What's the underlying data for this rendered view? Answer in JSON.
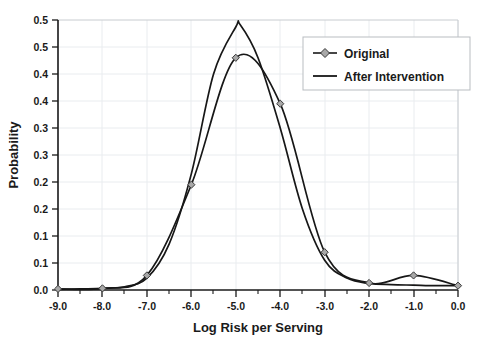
{
  "chart_data": {
    "type": "line",
    "title": "",
    "xlabel": "Log Risk per Serving",
    "ylabel": "Probability",
    "xlim": [
      -9.0,
      0.0
    ],
    "ylim": [
      0.0,
      0.5
    ],
    "grid": true,
    "legend_position": "top-right",
    "x_tick_labels": [
      "-9.0",
      "-8.0",
      "-7.0",
      "-6.0",
      "-5.0",
      "-4.0",
      "-3.0",
      "-2.0",
      "-1.0",
      "0.0"
    ],
    "x_tick_values": [
      -9.0,
      -8.0,
      -7.0,
      -6.0,
      -5.0,
      -4.0,
      -3.0,
      -2.0,
      -1.0,
      0.0
    ],
    "y_tick_labels": [
      "0.5",
      "0.5",
      "0.4",
      "0.4",
      "0.3",
      "0.3",
      "0.2",
      "0.2",
      "0.1",
      "0.1",
      "0.0"
    ],
    "y_tick_values": [
      0.5,
      0.45,
      0.4,
      0.35,
      0.3,
      0.25,
      0.2,
      0.15,
      0.1,
      0.05,
      0.0
    ],
    "categories": [
      -9.0,
      -8.0,
      -7.0,
      -6.0,
      -5.0,
      -4.0,
      -3.0,
      -2.0,
      -1.0,
      0.0
    ],
    "series": [
      {
        "name": "Original",
        "marker": "diamond",
        "marker_color": "#a8a8a8",
        "line_color": "#171717",
        "x": [
          -9.0,
          -8.0,
          -7.0,
          -6.0,
          -5.0,
          -4.0,
          -3.0,
          -2.0,
          -1.0,
          0.0
        ],
        "values": [
          0.002,
          0.003,
          0.027,
          0.195,
          0.43,
          0.345,
          0.07,
          0.013,
          0.027,
          0.008
        ]
      },
      {
        "name": "After Intervention",
        "marker": "none",
        "line_color": "#171717",
        "x": [
          -9.0,
          -8.5,
          -8.0,
          -7.5,
          -7.0,
          -6.5,
          -6.0,
          -5.5,
          -5.0,
          -4.9,
          -4.5,
          -4.0,
          -3.5,
          -3.0,
          -2.5,
          -2.0,
          -1.5,
          -1.0,
          -0.5,
          0.0
        ],
        "values": [
          0.001,
          0.002,
          0.003,
          0.006,
          0.022,
          0.085,
          0.215,
          0.4,
          0.487,
          0.491,
          0.43,
          0.3,
          0.15,
          0.055,
          0.022,
          0.012,
          0.01,
          0.009,
          0.008,
          0.008
        ]
      }
    ]
  },
  "legend": {
    "entries": [
      {
        "label": "Original",
        "style": "line-with-diamond-marker"
      },
      {
        "label": "After Intervention",
        "style": "plain-line"
      }
    ]
  }
}
